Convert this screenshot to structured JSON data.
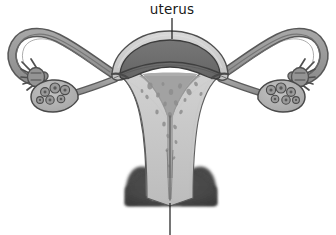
{
  "figure": {
    "background_color": "#ffffff",
    "width": 336,
    "height": 235,
    "style": "grayscale line drawing, cutaway / coronal section"
  },
  "labels": [
    {
      "id": "uterus",
      "text": "uterus",
      "text_x": 172,
      "text_y": 14,
      "leader_x1": 172,
      "leader_y1": 18,
      "leader_x2": 172,
      "leader_y2": 39,
      "color": "#1a1a1a"
    },
    {
      "id": "cervix-leader",
      "text": "",
      "text_x": 170,
      "text_y": 234,
      "leader_x1": 170,
      "leader_y1": 203,
      "leader_x2": 170,
      "leader_y2": 235,
      "color": "#1a1a1a"
    }
  ],
  "colors": {
    "background": "#ffffff",
    "outline": "#3a3a3a",
    "outline_soft": "#585858",
    "serosa_light": "#cfcfcf",
    "myometrium": "#c4c4c4",
    "myometrium_dark": "#ababab",
    "endometrium_dark": "#6e6e6e",
    "cavity_speckle": "#8d8d8d",
    "cavity_fill": "#a9a9a9",
    "tube_gray": "#9a9a9a",
    "tube_dark": "#6a6a6a",
    "ovary_fill": "#b3b3b3",
    "ovary_follicle": "#9a9a9a",
    "follicle_core": "#5a5a5a",
    "cervix_dark": "#4a4a4a",
    "vagina_dark": "#3f3f3f",
    "label_text": "#1a1a1a"
  },
  "structures": [
    {
      "id": "uterine-fundus",
      "name": "uterine fundus",
      "side": "center"
    },
    {
      "id": "uterine-body",
      "name": "uterine body",
      "side": "center"
    },
    {
      "id": "endometrium",
      "name": "endometrium",
      "side": "center"
    },
    {
      "id": "myometrium",
      "name": "myometrium",
      "side": "center"
    },
    {
      "id": "uterine-cavity",
      "name": "uterine cavity",
      "side": "center"
    },
    {
      "id": "cervical-canal",
      "name": "cervical canal",
      "side": "center"
    },
    {
      "id": "cervix",
      "name": "cervix",
      "side": "center"
    },
    {
      "id": "vagina",
      "name": "vaginal canal",
      "side": "center"
    },
    {
      "id": "fallopian-tube-l",
      "name": "left fallopian tube",
      "side": "left"
    },
    {
      "id": "fallopian-tube-r",
      "name": "right fallopian tube",
      "side": "right"
    },
    {
      "id": "fimbriae-l",
      "name": "left fimbriae",
      "side": "left"
    },
    {
      "id": "fimbriae-r",
      "name": "right fimbriae",
      "side": "right"
    },
    {
      "id": "ovary-l",
      "name": "left ovary",
      "side": "left"
    },
    {
      "id": "ovary-r",
      "name": "right ovary",
      "side": "right"
    },
    {
      "id": "ligament-l",
      "name": "left ovarian ligament",
      "side": "left"
    },
    {
      "id": "ligament-r",
      "name": "right ovarian ligament",
      "side": "right"
    }
  ],
  "follicles": {
    "left": [
      {
        "cx": 45,
        "cy": 92,
        "r": 4.4
      },
      {
        "cx": 55,
        "cy": 88,
        "r": 5.0
      },
      {
        "cx": 65,
        "cy": 90,
        "r": 4.6
      },
      {
        "cx": 50,
        "cy": 100,
        "r": 4.2
      },
      {
        "cx": 61,
        "cy": 99,
        "r": 3.8
      },
      {
        "cx": 40,
        "cy": 100,
        "r": 3.4
      }
    ],
    "right": [
      {
        "cx": 291,
        "cy": 92,
        "r": 4.4
      },
      {
        "cx": 281,
        "cy": 88,
        "r": 5.0
      },
      {
        "cx": 271,
        "cy": 90,
        "r": 4.6
      },
      {
        "cx": 286,
        "cy": 100,
        "r": 4.2
      },
      {
        "cx": 275,
        "cy": 99,
        "r": 3.8
      },
      {
        "cx": 296,
        "cy": 100,
        "r": 3.4
      }
    ]
  },
  "cavity_speckles": [
    {
      "cx": 150,
      "cy": 86,
      "rx": 2.6,
      "ry": 3.4
    },
    {
      "cx": 158,
      "cy": 95,
      "rx": 1.9,
      "ry": 2.6
    },
    {
      "cx": 147,
      "cy": 97,
      "rx": 1.6,
      "ry": 2.2
    },
    {
      "cx": 163,
      "cy": 84,
      "rx": 1.5,
      "ry": 2.0
    },
    {
      "cx": 171,
      "cy": 92,
      "rx": 2.2,
      "ry": 3.0
    },
    {
      "cx": 180,
      "cy": 86,
      "rx": 2.0,
      "ry": 2.7
    },
    {
      "cx": 189,
      "cy": 92,
      "rx": 2.4,
      "ry": 3.2
    },
    {
      "cx": 196,
      "cy": 84,
      "rx": 1.8,
      "ry": 2.4
    },
    {
      "cx": 165,
      "cy": 104,
      "rx": 1.8,
      "ry": 2.6
    },
    {
      "cx": 176,
      "cy": 103,
      "rx": 2.0,
      "ry": 2.8
    },
    {
      "cx": 185,
      "cy": 100,
      "rx": 1.5,
      "ry": 2.1
    },
    {
      "cx": 157,
      "cy": 112,
      "rx": 1.7,
      "ry": 2.4
    },
    {
      "cx": 170,
      "cy": 115,
      "rx": 2.1,
      "ry": 3.0
    },
    {
      "cx": 181,
      "cy": 112,
      "rx": 1.6,
      "ry": 2.3
    },
    {
      "cx": 164,
      "cy": 124,
      "rx": 1.8,
      "ry": 2.6
    },
    {
      "cx": 175,
      "cy": 127,
      "rx": 1.7,
      "ry": 2.4
    },
    {
      "cx": 168,
      "cy": 136,
      "rx": 1.5,
      "ry": 2.2
    },
    {
      "cx": 176,
      "cy": 142,
      "rx": 1.4,
      "ry": 2.0
    },
    {
      "cx": 167,
      "cy": 150,
      "rx": 1.3,
      "ry": 1.9
    },
    {
      "cx": 174,
      "cy": 158,
      "rx": 1.2,
      "ry": 1.8
    },
    {
      "cx": 169,
      "cy": 166,
      "rx": 1.1,
      "ry": 1.6
    },
    {
      "cx": 142,
      "cy": 91,
      "rx": 1.4,
      "ry": 1.9
    },
    {
      "cx": 201,
      "cy": 94,
      "rx": 1.5,
      "ry": 2.0
    }
  ]
}
